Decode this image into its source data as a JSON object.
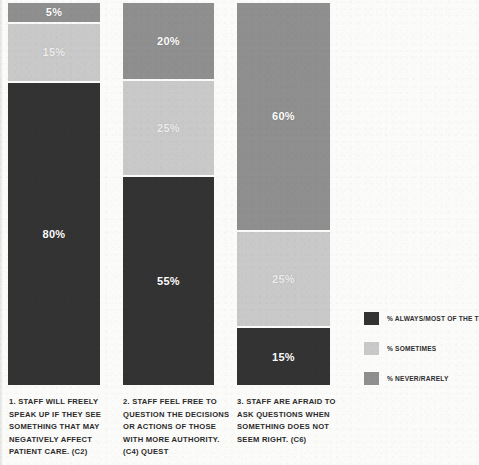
{
  "chart_data": {
    "type": "bar",
    "subtype": "stacked-100-percent-vertical",
    "title": "",
    "subtitle": "",
    "xlabel": "",
    "ylabel": "",
    "ylim": [
      0,
      100
    ],
    "grid": false,
    "legend_position": "right",
    "stack_order_top_to_bottom": [
      "% NEVER/RARELY",
      "% SOMETIMES",
      "% ALWAYS/MOST OF THE TIME"
    ],
    "categories": [
      "1. STAFF WILL FREELY\nSPEAK UP IF THEY SEE\nSOMETHING THAT MAY\nNEGATIVELY AFFECT\nPATIENT CARE. (C2)",
      "2. STAFF FEEL FREE TO\nQUESTION THE DECISIONS\nOR ACTIONS OF THOSE\nWITH MORE AUTHORITY.\n(C4) QUEST",
      "3. STAFF ARE AFRAID TO\nASK QUESTIONS WHEN\nSOMETHING DOES NOT\nSEEM RIGHT. (C6)"
    ],
    "series": [
      {
        "name": "% ALWAYS/MOST OF THE TIME",
        "color": "#333333",
        "values": [
          80,
          55,
          15
        ],
        "labels": [
          "80%",
          "55%",
          "15%"
        ]
      },
      {
        "name": "% SOMETIMES",
        "color": "#c9c9c9",
        "values": [
          15,
          25,
          25
        ],
        "labels": [
          "15%",
          "25%",
          "25%"
        ]
      },
      {
        "name": "% NEVER/RARELY",
        "color": "#8f8f8f",
        "values": [
          5,
          20,
          60
        ],
        "labels": [
          "5%",
          "20%",
          "60%"
        ]
      }
    ],
    "bars": [
      {
        "category_index": 0,
        "segments_top_to_bottom": [
          {
            "series": "% NEVER/RARELY",
            "value": 5,
            "label": "5%",
            "color": "#8f8f8f"
          },
          {
            "series": "% SOMETIMES",
            "value": 15,
            "label": "15%",
            "color": "#c9c9c9"
          },
          {
            "series": "% ALWAYS/MOST OF THE TIME",
            "value": 80,
            "label": "80%",
            "color": "#333333"
          }
        ]
      },
      {
        "category_index": 1,
        "segments_top_to_bottom": [
          {
            "series": "% NEVER/RARELY",
            "value": 20,
            "label": "20%",
            "color": "#8f8f8f"
          },
          {
            "series": "% SOMETIMES",
            "value": 25,
            "label": "25%",
            "color": "#c9c9c9"
          },
          {
            "series": "% ALWAYS/MOST OF THE TIME",
            "value": 55,
            "label": "55%",
            "color": "#333333"
          }
        ]
      },
      {
        "category_index": 2,
        "segments_top_to_bottom": [
          {
            "series": "% NEVER/RARELY",
            "value": 60,
            "label": "60%",
            "color": "#8f8f8f"
          },
          {
            "series": "% SOMETIMES",
            "value": 25,
            "label": "25%",
            "color": "#c9c9c9"
          },
          {
            "series": "% ALWAYS/MOST OF THE TIME",
            "value": 15,
            "label": "15%",
            "color": "#333333"
          }
        ]
      }
    ]
  },
  "legend": {
    "items": [
      {
        "label": "% ALWAYS/MOST OF THE TIME",
        "color": "#333333"
      },
      {
        "label": "% SOMETIMES",
        "color": "#c9c9c9"
      },
      {
        "label": "% NEVER/RARELY",
        "color": "#8f8f8f"
      }
    ]
  }
}
